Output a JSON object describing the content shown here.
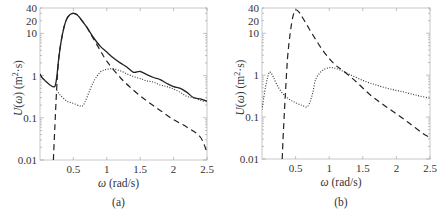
{
  "chart_data": [
    {
      "panel": "(a)",
      "type": "line",
      "xlabel": "ω (rad/s)",
      "ylabel": "U(ω) (m²·s)",
      "xlim": [
        0,
        2.5
      ],
      "ylim": [
        0.01,
        40
      ],
      "yscale": "log",
      "xticks": [
        "0.5",
        "1",
        "1.5",
        "2",
        "2.5"
      ],
      "yticks": [
        "0.01",
        "0.1",
        "1",
        "10",
        "20",
        "40"
      ],
      "grid": false,
      "series": [
        {
          "name": "solid",
          "style": "solid",
          "x": [
            0.0,
            0.03,
            0.08,
            0.15,
            0.22,
            0.25,
            0.28,
            0.32,
            0.36,
            0.4,
            0.45,
            0.5,
            0.55,
            0.6,
            0.7,
            0.8,
            0.9,
            1.0,
            1.1,
            1.2,
            1.3,
            1.4,
            1.5,
            1.6,
            1.7,
            1.8,
            1.9,
            2.0,
            2.1,
            2.2,
            2.3,
            2.4,
            2.5
          ],
          "y": [
            1.1,
            0.9,
            0.75,
            0.6,
            0.55,
            0.9,
            2.5,
            7.0,
            14.0,
            22.0,
            28.0,
            30.0,
            28.0,
            23.0,
            14.0,
            8.0,
            5.0,
            3.6,
            2.6,
            2.0,
            1.6,
            1.2,
            1.25,
            1.05,
            0.9,
            0.8,
            0.65,
            0.55,
            0.5,
            0.4,
            0.3,
            0.28,
            0.25
          ]
        },
        {
          "name": "dashed",
          "style": "dashed",
          "x": [
            0.2,
            0.22,
            0.25,
            0.28,
            0.32,
            0.36,
            0.4,
            0.45,
            0.5,
            0.55,
            0.6,
            0.7,
            0.8,
            0.9,
            1.0,
            1.2,
            1.4,
            1.6,
            1.8,
            2.0,
            2.2,
            2.4,
            2.5
          ],
          "y": [
            0.01,
            0.05,
            0.5,
            2.5,
            7.0,
            14.0,
            22.0,
            28.0,
            30.0,
            28.0,
            23.0,
            14.0,
            7.5,
            4.0,
            2.2,
            0.9,
            0.45,
            0.25,
            0.15,
            0.09,
            0.06,
            0.035,
            0.015
          ]
        },
        {
          "name": "dotted",
          "style": "dotted",
          "x": [
            0.25,
            0.3,
            0.4,
            0.5,
            0.6,
            0.65,
            0.7,
            0.8,
            0.9,
            1.0,
            1.1,
            1.2,
            1.3,
            1.4,
            1.5,
            1.6,
            1.7,
            1.8,
            1.9,
            2.0,
            2.1,
            2.2,
            2.3,
            2.4,
            2.5
          ],
          "y": [
            0.45,
            0.35,
            0.25,
            0.22,
            0.19,
            0.2,
            0.3,
            0.7,
            1.2,
            1.4,
            1.45,
            1.3,
            1.1,
            0.95,
            0.85,
            0.75,
            0.7,
            0.6,
            0.55,
            0.48,
            0.4,
            0.32,
            0.3,
            0.26,
            0.24
          ]
        }
      ]
    },
    {
      "panel": "(b)",
      "type": "line",
      "xlabel": "ω (rad/s)",
      "ylabel": "U(ω) (m²·s)",
      "xlim": [
        0,
        2.5
      ],
      "ylim": [
        0.01,
        40
      ],
      "yscale": "log",
      "xticks": [
        "0.5",
        "1",
        "1.5",
        "2",
        "2.5"
      ],
      "yticks": [
        "0.01",
        "0.1",
        "1",
        "10",
        "20",
        "40"
      ],
      "grid": false,
      "series": [
        {
          "name": "dashed",
          "style": "dashed",
          "x": [
            0.3,
            0.32,
            0.35,
            0.38,
            0.42,
            0.46,
            0.5,
            0.55,
            0.6,
            0.7,
            0.8,
            0.9,
            1.0,
            1.1,
            1.2,
            1.4,
            1.6,
            1.8,
            2.0,
            2.2,
            2.4,
            2.5
          ],
          "y": [
            0.01,
            0.05,
            0.4,
            2.5,
            10.0,
            25.0,
            36.0,
            32.0,
            24.0,
            13.0,
            7.0,
            4.0,
            2.5,
            1.7,
            1.3,
            0.7,
            0.35,
            0.2,
            0.12,
            0.07,
            0.04,
            0.033
          ]
        },
        {
          "name": "dotted",
          "style": "dotted",
          "x": [
            0.0,
            0.05,
            0.1,
            0.13,
            0.17,
            0.22,
            0.3,
            0.4,
            0.5,
            0.6,
            0.68,
            0.75,
            0.8,
            0.9,
            1.0,
            1.05,
            1.1,
            1.2,
            1.3,
            1.5,
            1.7,
            1.9,
            2.1,
            2.3,
            2.5
          ],
          "y": [
            0.15,
            0.5,
            1.1,
            1.15,
            0.9,
            0.6,
            0.38,
            0.27,
            0.22,
            0.19,
            0.18,
            0.35,
            0.8,
            1.3,
            1.5,
            1.5,
            1.45,
            1.25,
            1.05,
            0.75,
            0.58,
            0.47,
            0.4,
            0.33,
            0.28
          ]
        }
      ]
    }
  ],
  "labels": {
    "panel_a": "(a)",
    "panel_b": "(b)",
    "xlabel": "ω (rad/s)",
    "ylabel": "U(ω) (m²·s)"
  }
}
